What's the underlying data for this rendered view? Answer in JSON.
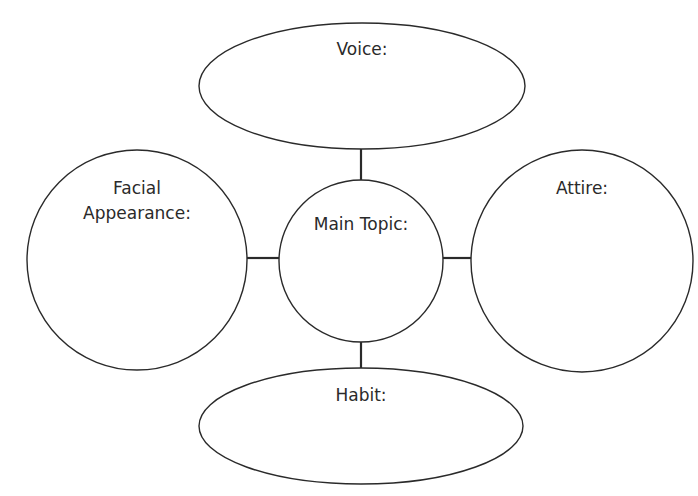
{
  "diagram": {
    "type": "character web / graphic organizer",
    "stroke_color": "#2a2a2a",
    "background": "#ffffff",
    "center": {
      "label": "Main Topic:"
    },
    "nodes": [
      {
        "id": "top",
        "label": "Voice:"
      },
      {
        "id": "left",
        "label": "Facial Appearance:",
        "lines": [
          "Facial",
          "Appearance:"
        ]
      },
      {
        "id": "right",
        "label": "Attire:"
      },
      {
        "id": "bottom",
        "label": "Habit:"
      }
    ]
  }
}
